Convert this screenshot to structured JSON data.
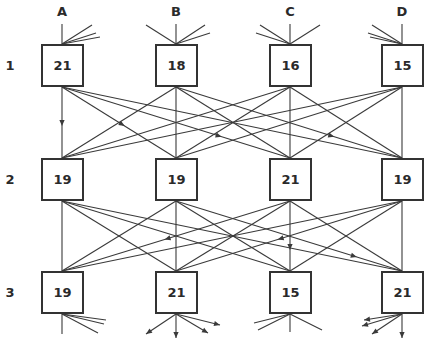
{
  "columns": [
    {
      "label": "A",
      "x": 62
    },
    {
      "label": "B",
      "x": 176
    },
    {
      "label": "C",
      "x": 290
    },
    {
      "label": "D",
      "x": 402
    }
  ],
  "rows": [
    {
      "label": "1",
      "y": 65
    },
    {
      "label": "2",
      "y": 179
    },
    {
      "label": "3",
      "y": 292
    }
  ],
  "nodes": [
    [
      {
        "value": "21"
      },
      {
        "value": "18"
      },
      {
        "value": "16"
      },
      {
        "value": "15"
      }
    ],
    [
      {
        "value": "19"
      },
      {
        "value": "19"
      },
      {
        "value": "21"
      },
      {
        "value": "19"
      }
    ],
    [
      {
        "value": "19"
      },
      {
        "value": "21"
      },
      {
        "value": "15"
      },
      {
        "value": "21"
      }
    ]
  ],
  "arrows_layer1_to_2": [
    {
      "from": "A1",
      "to": "A2"
    },
    {
      "from": "A1",
      "to": "B2"
    },
    {
      "from": "A1",
      "to": "C2"
    },
    {
      "from": "B1",
      "to": "D2"
    }
  ],
  "arrows_layer2_to_3": [
    {
      "from": "C2",
      "to": "A3"
    },
    {
      "from": "D2",
      "to": "B3"
    },
    {
      "from": "C2",
      "to": "C3"
    },
    {
      "from": "B2",
      "to": "D3"
    }
  ],
  "colors": {
    "line": "#3a3a3a",
    "box_border": "#333333",
    "text": "#2a2a2a",
    "background": "#ffffff"
  }
}
